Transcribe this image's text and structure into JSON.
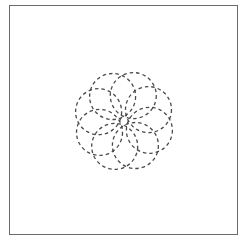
{
  "diagram": {
    "type": "dashed-pinwheel-flower",
    "petal_count": 8,
    "center": [
      124,
      121
    ],
    "petal_radius": 23,
    "petal_offset": 27,
    "stroke_color": "#4a4a4a",
    "frame_color": "#6a6a6a"
  }
}
